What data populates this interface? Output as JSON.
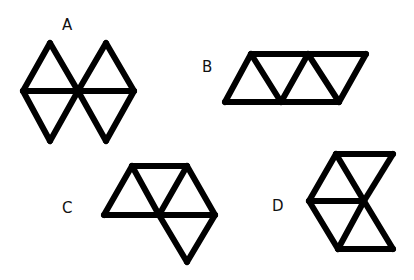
{
  "figures": [
    {
      "label": "A",
      "label_pos": [
        62,
        18
      ],
      "description": "Two rhombi side by side, each split horizontally into two triangles",
      "segments": [
        [
          [
            50,
            43
          ],
          [
            23,
            91
          ]
        ],
        [
          [
            23,
            91
          ],
          [
            50,
            141
          ]
        ],
        [
          [
            50,
            43
          ],
          [
            78,
            91
          ]
        ],
        [
          [
            78,
            91
          ],
          [
            50,
            141
          ]
        ],
        [
          [
            106,
            43
          ],
          [
            78,
            91
          ]
        ],
        [
          [
            78,
            91
          ],
          [
            106,
            141
          ]
        ],
        [
          [
            106,
            43
          ],
          [
            134,
            91
          ]
        ],
        [
          [
            134,
            91
          ],
          [
            106,
            141
          ]
        ],
        [
          [
            23,
            91
          ],
          [
            134,
            91
          ]
        ]
      ]
    },
    {
      "label": "B",
      "label_pos": [
        202,
        60
      ],
      "description": "Parallelogram made of four triangles in a row",
      "segments": [
        [
          [
            251,
            54
          ],
          [
            366,
            54
          ]
        ],
        [
          [
            225,
            102
          ],
          [
            339,
            102
          ]
        ],
        [
          [
            251,
            54
          ],
          [
            225,
            102
          ]
        ],
        [
          [
            251,
            54
          ],
          [
            281,
            102
          ]
        ],
        [
          [
            308,
            54
          ],
          [
            281,
            102
          ]
        ],
        [
          [
            308,
            54
          ],
          [
            339,
            102
          ]
        ],
        [
          [
            366,
            54
          ],
          [
            339,
            102
          ]
        ]
      ]
    },
    {
      "label": "C",
      "label_pos": [
        62,
        201
      ],
      "description": "Two triangles on top, one triangle hanging below on the right",
      "segments": [
        [
          [
            132,
            166
          ],
          [
            187,
            166
          ]
        ],
        [
          [
            132,
            166
          ],
          [
            104,
            215
          ]
        ],
        [
          [
            132,
            166
          ],
          [
            159,
            215
          ]
        ],
        [
          [
            187,
            166
          ],
          [
            159,
            215
          ]
        ],
        [
          [
            187,
            166
          ],
          [
            215,
            215
          ]
        ],
        [
          [
            104,
            215
          ],
          [
            215,
            215
          ]
        ],
        [
          [
            159,
            215
          ],
          [
            187,
            262
          ]
        ],
        [
          [
            215,
            215
          ],
          [
            187,
            262
          ]
        ]
      ]
    },
    {
      "label": "D",
      "label_pos": [
        272,
        199
      ],
      "description": "Trapezoid of triangles forming an arrow/notch shape",
      "segments": [
        [
          [
            336,
            154
          ],
          [
            393,
            154
          ]
        ],
        [
          [
            336,
            154
          ],
          [
            309,
            201
          ]
        ],
        [
          [
            336,
            154
          ],
          [
            364,
            201
          ]
        ],
        [
          [
            393,
            154
          ],
          [
            364,
            201
          ]
        ],
        [
          [
            309,
            201
          ],
          [
            364,
            201
          ]
        ],
        [
          [
            309,
            201
          ],
          [
            338,
            249
          ]
        ],
        [
          [
            364,
            201
          ],
          [
            338,
            249
          ]
        ],
        [
          [
            364,
            201
          ],
          [
            393,
            249
          ]
        ],
        [
          [
            338,
            249
          ],
          [
            393,
            249
          ]
        ]
      ]
    }
  ],
  "style": {
    "stroke": "#000000",
    "stroke_width": 6,
    "background": "#ffffff"
  }
}
